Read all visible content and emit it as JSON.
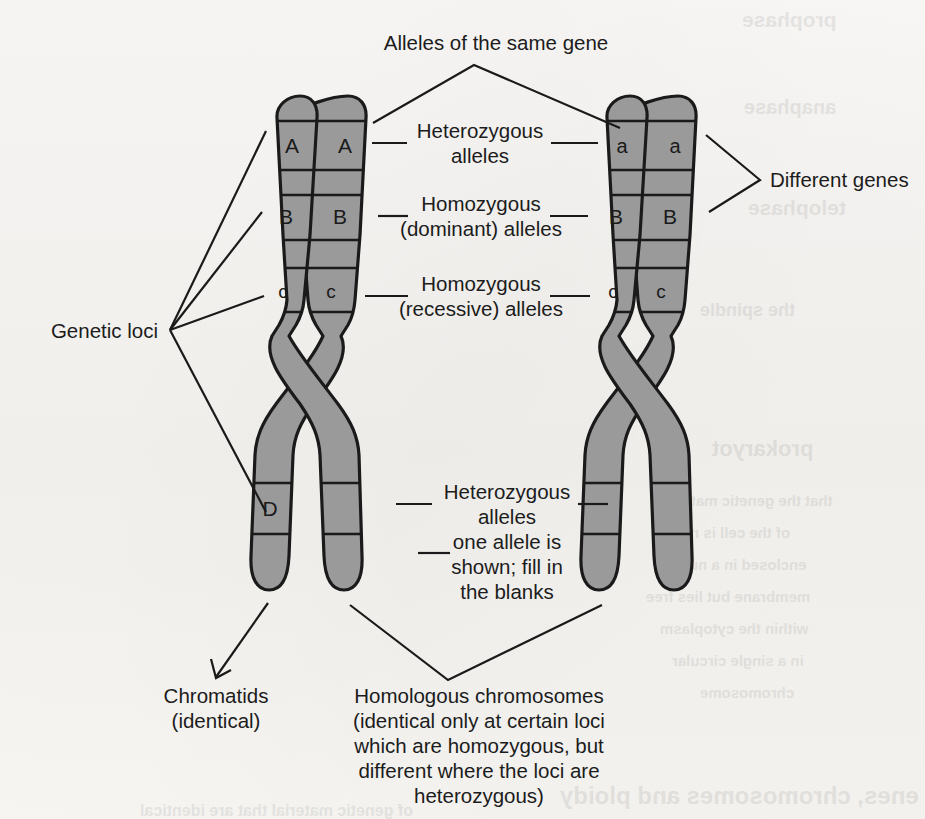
{
  "diagram": {
    "title_top": "Alleles of the same gene",
    "label_different_genes": "Different genes",
    "label_genetic_loci": "Genetic loci",
    "label_het_top_l1": "Heterozygous",
    "label_het_top_l2": "alleles",
    "label_homo_dom_l1": "Homozygous",
    "label_homo_dom_l2": "(dominant) alleles",
    "label_homo_rec_l1": "Homozygous",
    "label_homo_rec_l2": "(recessive) alleles",
    "label_het_bottom_l1": "Heterozygous",
    "label_het_bottom_l2": "alleles",
    "label_het_bottom_l3": "one allele is",
    "label_het_bottom_l4": "shown; fill in",
    "label_het_bottom_l5": "the blanks",
    "label_chromatids_l1": "Chromatids",
    "label_chromatids_l2": "(identical)",
    "label_homologous_l1": "Homologous chromosomes",
    "label_homologous_l2": "(identical only at certain loci",
    "label_homologous_l3": "which are homozygous, but",
    "label_homologous_l4": "different where the loci are",
    "label_homologous_l5": "heterozygous)"
  },
  "alleles": {
    "left_chromosome": {
      "chromatid_1": [
        "A",
        "B",
        "c",
        "D"
      ],
      "chromatid_2": [
        "A",
        "B",
        "c",
        ""
      ]
    },
    "right_chromosome": {
      "chromatid_1": [
        "a",
        "B",
        "c",
        ""
      ],
      "chromatid_2": [
        "a",
        "B",
        "c",
        ""
      ]
    }
  },
  "colors": {
    "chromosome_fill": "#9a9a9a",
    "chromosome_stroke": "#1a1a1a",
    "band_line": "#1a1a1a",
    "background": "#f7f6f4",
    "text": "#1c1c1c"
  },
  "ghost_text": [
    {
      "text": "prophase",
      "x": 742,
      "y": 8,
      "size": 21
    },
    {
      "text": "anaphase",
      "x": 744,
      "y": 96,
      "size": 20
    },
    {
      "text": "telophase",
      "x": 748,
      "y": 196,
      "size": 21
    },
    {
      "text": "the spindle",
      "x": 700,
      "y": 300,
      "size": 18
    },
    {
      "text": "prokaryot",
      "x": 712,
      "y": 436,
      "size": 22
    },
    {
      "text": "that the genetic material",
      "x": 660,
      "y": 492,
      "size": 15
    },
    {
      "text": "of the cell is not",
      "x": 676,
      "y": 524,
      "size": 15
    },
    {
      "text": "enclosed in a nuclear",
      "x": 654,
      "y": 556,
      "size": 15
    },
    {
      "text": "membrane but lies free",
      "x": 646,
      "y": 588,
      "size": 15
    },
    {
      "text": "within the cytoplasm",
      "x": 660,
      "y": 620,
      "size": 15
    },
    {
      "text": "in a single circular",
      "x": 672,
      "y": 652,
      "size": 15
    },
    {
      "text": "chromosome",
      "x": 700,
      "y": 684,
      "size": 15
    },
    {
      "text": "enes, chromosomes and ploidy",
      "x": 560,
      "y": 782,
      "size": 24
    },
    {
      "text": "of genetic material that are identical",
      "x": 140,
      "y": 802,
      "size": 16
    }
  ]
}
